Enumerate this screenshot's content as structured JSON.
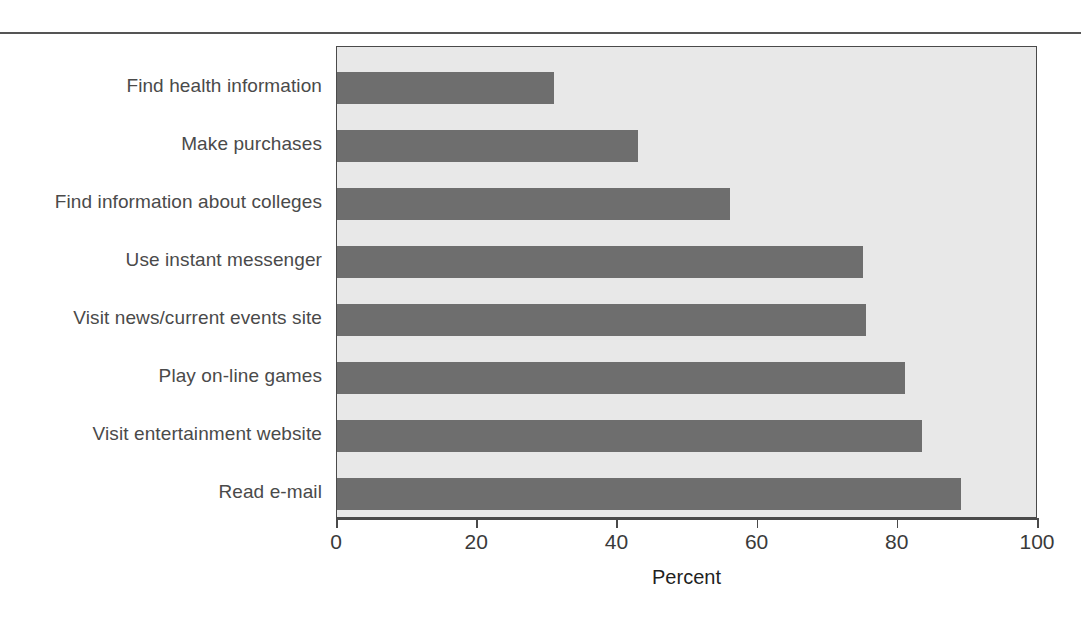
{
  "chart_data": {
    "type": "bar",
    "orientation": "horizontal",
    "title": "",
    "subtitle": "",
    "xlabel": "Percent",
    "ylabel": "",
    "xlim": [
      0,
      100
    ],
    "xticks": [
      0,
      20,
      40,
      60,
      80,
      100
    ],
    "xtick_labels": [
      "0",
      "20",
      "40",
      "60",
      "80",
      "100"
    ],
    "grid": false,
    "legend": false,
    "categories": [
      "Find health information",
      "Make purchases",
      "Find information about colleges",
      "Use instant messenger",
      "Visit news/current events site",
      "Play on-line games",
      "Visit entertainment website",
      "Read e-mail"
    ],
    "values": [
      31,
      43,
      56,
      75,
      75.5,
      81,
      83.5,
      89
    ],
    "bar_color": "#6e6e6e",
    "plot_background": "#e8e8e8",
    "axis_color": "#4a4a4a"
  },
  "axis": {
    "x_title": "Percent"
  }
}
